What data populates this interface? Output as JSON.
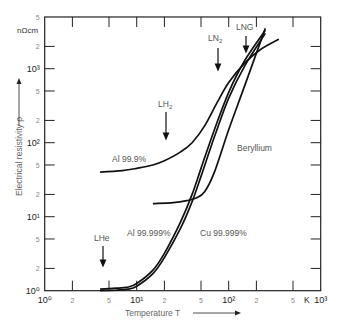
{
  "chart_data": {
    "type": "line",
    "title": "",
    "xlabel": "Temperature T",
    "ylabel": "Electrical resistivity ρ",
    "x_unit": "K",
    "y_unit": "nΩcm",
    "xscale": "log",
    "yscale": "log",
    "xlim": [
      1,
      1000
    ],
    "ylim": [
      1,
      5000
    ],
    "x_ticks": [
      {
        "value": 1,
        "label": "10⁰",
        "major": true
      },
      {
        "value": 2,
        "label": "2"
      },
      {
        "value": 5,
        "label": "5"
      },
      {
        "value": 10,
        "label": "10¹",
        "major": true
      },
      {
        "value": 20,
        "label": "2"
      },
      {
        "value": 50,
        "label": "5"
      },
      {
        "value": 100,
        "label": "10²",
        "major": true
      },
      {
        "value": 200,
        "label": "2"
      },
      {
        "value": 500,
        "label": "5"
      },
      {
        "value": 1000,
        "label": "10³",
        "major": true
      }
    ],
    "y_ticks": [
      {
        "value": 1,
        "label": "10⁰",
        "major": true
      },
      {
        "value": 2,
        "label": "2"
      },
      {
        "value": 5,
        "label": "5"
      },
      {
        "value": 10,
        "label": "10¹",
        "major": true
      },
      {
        "value": 20,
        "label": "2"
      },
      {
        "value": 50,
        "label": "5"
      },
      {
        "value": 100,
        "label": "10²",
        "major": true
      },
      {
        "value": 200,
        "label": "2"
      },
      {
        "value": 500,
        "label": "5"
      },
      {
        "value": 1000,
        "label": "10³",
        "major": true
      },
      {
        "value": 2000,
        "label": "2"
      },
      {
        "value": 5000,
        "label": "5"
      }
    ],
    "grid": false,
    "legend": "inline labels",
    "series": [
      {
        "name": "Al 99.9%",
        "x": [
          4,
          7,
          10,
          15,
          20,
          30,
          40,
          55,
          75,
          100,
          150,
          220,
          350
        ],
        "values": [
          40,
          42,
          45,
          50,
          57,
          75,
          100,
          170,
          350,
          650,
          1200,
          1800,
          2500
        ]
      },
      {
        "name": "Beryllium",
        "x": [
          15,
          25,
          35,
          45,
          55,
          70,
          100,
          150,
          250
        ],
        "values": [
          15,
          15.5,
          16.5,
          18,
          22,
          40,
          150,
          600,
          3500
        ]
      },
      {
        "name": "Al 99.999%",
        "x": [
          4,
          6,
          8,
          10,
          15,
          20,
          30,
          40,
          50,
          70,
          100,
          150,
          250
        ],
        "values": [
          1.0,
          1.02,
          1.05,
          1.15,
          1.7,
          2.8,
          7,
          16,
          35,
          120,
          400,
          1100,
          3000
        ]
      },
      {
        "name": "Cu 99.999%",
        "x": [
          4,
          6,
          8,
          10,
          15,
          20,
          30,
          40,
          50,
          70,
          100,
          150,
          250
        ],
        "values": [
          1.05,
          1.08,
          1.12,
          1.25,
          1.9,
          3.2,
          8.5,
          20,
          45,
          150,
          480,
          1300,
          3300
        ]
      }
    ],
    "annotations": [
      {
        "label": "LHe",
        "T": 4.2,
        "arrow": true
      },
      {
        "label": "LH₂",
        "T": 20,
        "arrow": true
      },
      {
        "label": "LN₂",
        "T": 77,
        "arrow": true
      },
      {
        "label": "LNG",
        "T": 112,
        "arrow": true
      }
    ]
  },
  "labels": {
    "y_unit": "nΩcm",
    "y_title": "Electrical resistivity ρ",
    "x_title": "Temperature T",
    "x_unit": "K",
    "al999": "Al 99.9%",
    "be": "Beryllium",
    "al99999": "Al 99.999%",
    "cu99999": "Cu 99.999%",
    "lhe": "LHe",
    "lh2": "LH",
    "lh2_sub": "2",
    "ln2": "LN",
    "ln2_sub": "2",
    "lng": "LNG"
  }
}
